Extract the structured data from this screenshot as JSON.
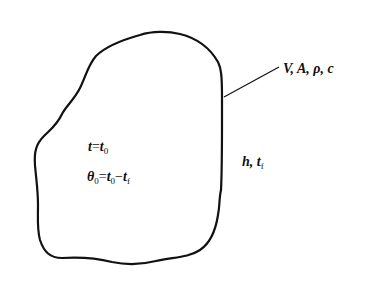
{
  "diagram": {
    "type": "lumped-capacitance body sketch",
    "body": {
      "shape": "irregular closed blob",
      "stroke_color": "#111111",
      "stroke_width": 2.2
    },
    "leader_line": {
      "from": [
        224,
        97
      ],
      "to": [
        279,
        67
      ],
      "color": "#111111"
    },
    "labels": {
      "properties": {
        "text": "V, A, ρ, c"
      },
      "initial_time": {
        "var": "t",
        "eq": "=",
        "rhs": "t",
        "rhs_sub": "0"
      },
      "initial_excess_temp": {
        "lhs": "θ",
        "lhs_sub": "0",
        "eq": "=",
        "a": "t",
        "a_sub": "0",
        "minus": "−",
        "b": "t",
        "b_sub": "f"
      },
      "environment": {
        "a": "h",
        "sep": ", ",
        "b": "t",
        "b_sub": "f"
      }
    }
  }
}
